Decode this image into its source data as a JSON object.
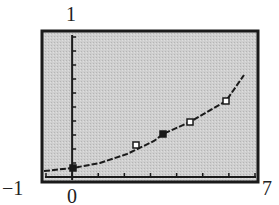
{
  "chart_data": {
    "type": "scatter",
    "title": "",
    "xlabel": "",
    "ylabel": "",
    "xlim": [
      -1,
      7
    ],
    "ylim": [
      0,
      1
    ],
    "x_tick_step": 1,
    "y_tick_count": 10,
    "grid": false,
    "legend": null,
    "corner_labels": {
      "ymax": "1",
      "xmin": "−1",
      "xmax": "7",
      "origin": "0"
    },
    "series": [
      {
        "name": "data points",
        "kind": "scatter",
        "points": [
          {
            "x": 0,
            "y": 0.06,
            "marker": "filled-square"
          },
          {
            "x": 2.3,
            "y": 0.24,
            "marker": "open-square"
          },
          {
            "x": 3.3,
            "y": 0.33,
            "marker": "filled-square"
          },
          {
            "x": 4.3,
            "y": 0.42,
            "marker": "open-square"
          },
          {
            "x": 5.6,
            "y": 0.58,
            "marker": "open-square"
          }
        ]
      },
      {
        "name": "exponential fit",
        "kind": "line",
        "style": "dashed-pixel",
        "equation": "y = a*e^(bx)",
        "points": [
          {
            "x": -0.9,
            "y": 0.04
          },
          {
            "x": 0,
            "y": 0.06
          },
          {
            "x": 1,
            "y": 0.12
          },
          {
            "x": 2,
            "y": 0.2
          },
          {
            "x": 3,
            "y": 0.3
          },
          {
            "x": 4,
            "y": 0.4
          },
          {
            "x": 5,
            "y": 0.5
          },
          {
            "x": 5.6,
            "y": 0.58
          },
          {
            "x": 6.3,
            "y": 0.78
          }
        ]
      }
    ]
  },
  "colors": {
    "frame": "#1a1a1a",
    "plot_background": "#c8c8c8",
    "axis": "#1a1a1a",
    "curve": "#1a1a1a",
    "text": "#222222"
  }
}
